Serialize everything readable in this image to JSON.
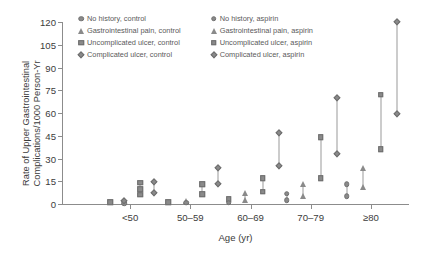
{
  "chart_data": {
    "type": "scatter",
    "title": "",
    "xlabel": "Age (yr)",
    "ylabel_lines": [
      "Rate of Upper Gastrointestinal",
      "Complications/1000 Person-Yr"
    ],
    "categories": [
      "<50",
      "50–59",
      "60–69",
      "70–79",
      "≥80"
    ],
    "yticks": [
      0,
      15,
      30,
      45,
      60,
      75,
      90,
      105,
      120
    ],
    "ylim": [
      0,
      120
    ],
    "grid": false,
    "legend_position": "top-center",
    "marker_color": "#8a8a8a",
    "axis_color": "#8c8c8c",
    "series": [
      {
        "name": "No history, control",
        "marker": "circle",
        "group": "control",
        "icon": "circle-marker-icon",
        "values": [
          0.3,
          0.5,
          0.9,
          2.6,
          5.0
        ]
      },
      {
        "name": "Gastrointestinal pain, control",
        "marker": "triangle",
        "group": "control",
        "icon": "triangle-marker-icon",
        "values": [
          0.9,
          1.2,
          2.3,
          5.2,
          11.5
        ]
      },
      {
        "name": "Uncomplicated ulcer, control",
        "marker": "square",
        "group": "control",
        "icon": "square-marker-icon",
        "values": [
          1.0,
          1.4,
          2.0,
          17.0,
          36.0
        ]
      },
      {
        "name": "Complicated ulcer, control",
        "marker": "diamond",
        "group": "control",
        "icon": "diamond-marker-icon",
        "values": [
          0.9,
          13.0,
          25.0,
          33.0,
          59.5
        ]
      },
      {
        "name": "No history, aspirin",
        "marker": "circle",
        "group": "aspirin",
        "icon": "circle-marker-icon",
        "values": [
          0.8,
          1.1,
          2.8,
          6.8,
          13.0
        ]
      },
      {
        "name": "Gastrointestinal pain, aspirin",
        "marker": "triangle",
        "group": "aspirin",
        "icon": "triangle-marker-icon",
        "values": [
          1.3,
          1.8,
          7.0,
          13.0,
          24.0
        ]
      },
      {
        "name": "Uncomplicated ulcer, aspirin",
        "marker": "square",
        "group": "aspirin",
        "icon": "square-marker-icon",
        "values": [
          14.0,
          8.0,
          8.0,
          44.0,
          72.0
        ]
      },
      {
        "name": "Complicated ulcer, aspirin",
        "marker": "diamond",
        "group": "aspirin",
        "icon": "diamond-marker-icon",
        "values": [
          14.5,
          24.0,
          46.5,
          70.0,
          120.0
        ]
      }
    ],
    "points": [
      {
        "cat": 0,
        "off": -20,
        "marker": "square",
        "value": 1.0,
        "label": "Uncomplicated ulcer, control"
      },
      {
        "cat": 0,
        "off": -6,
        "marker": "triangle",
        "value": 1.4,
        "label": "Gastrointestinal pain, control"
      },
      {
        "cat": 0,
        "off": -6,
        "marker": "circle",
        "value": 0.4,
        "label": "No history, control"
      },
      {
        "cat": 0,
        "off": -6,
        "marker": "diamond",
        "value": 2.2,
        "label": "Complicated ulcer, control"
      },
      {
        "cat": 0,
        "off": 10,
        "marker": "square",
        "value": 14.0,
        "label": "Uncomplicated ulcer, aspirin"
      },
      {
        "cat": 0,
        "off": 10,
        "marker": "square",
        "value": 9.8,
        "label": "Uncomplicated ulcer, aspirin"
      },
      {
        "cat": 0,
        "off": 10,
        "marker": "square",
        "value": 6.0,
        "label": "Uncomplicated ulcer, aspirin"
      },
      {
        "cat": 0,
        "off": 24,
        "marker": "diamond",
        "value": 14.5,
        "label": "Complicated ulcer, aspirin"
      },
      {
        "cat": 0,
        "off": 24,
        "marker": "diamond",
        "value": 7.5,
        "label": "Complicated ulcer, control"
      },
      {
        "cat": 1,
        "off": -22,
        "marker": "square",
        "value": 1.2,
        "label": "Uncomplicated ulcer, control"
      },
      {
        "cat": 1,
        "off": -4,
        "marker": "triangle",
        "value": 2.2,
        "label": "Gastrointestinal pain, aspirin"
      },
      {
        "cat": 1,
        "off": -4,
        "marker": "circle",
        "value": 0.8,
        "label": "No history, control"
      },
      {
        "cat": 1,
        "off": 12,
        "marker": "square",
        "value": 13.0,
        "label": "Uncomplicated ulcer, aspirin"
      },
      {
        "cat": 1,
        "off": 12,
        "marker": "square",
        "value": 6.5,
        "label": "Uncomplicated ulcer, control"
      },
      {
        "cat": 1,
        "off": 28,
        "marker": "diamond",
        "value": 24.0,
        "label": "Complicated ulcer, aspirin"
      },
      {
        "cat": 1,
        "off": 28,
        "marker": "diamond",
        "value": 13.0,
        "label": "Complicated ulcer, control"
      },
      {
        "cat": 2,
        "off": -22,
        "marker": "square",
        "value": 3.0,
        "label": "Uncomplicated ulcer, control"
      },
      {
        "cat": 2,
        "off": -22,
        "marker": "circle",
        "value": 0.8,
        "label": "No history, control"
      },
      {
        "cat": 2,
        "off": -6,
        "marker": "triangle",
        "value": 7.0,
        "label": "Gastrointestinal pain, aspirin"
      },
      {
        "cat": 2,
        "off": -6,
        "marker": "triangle",
        "value": 2.5,
        "label": "Gastrointestinal pain, control"
      },
      {
        "cat": 2,
        "off": 12,
        "marker": "square",
        "value": 17.0,
        "label": "Uncomplicated ulcer, aspirin"
      },
      {
        "cat": 2,
        "off": 12,
        "marker": "square",
        "value": 8.0,
        "label": "Uncomplicated ulcer, control"
      },
      {
        "cat": 2,
        "off": 28,
        "marker": "diamond",
        "value": 46.5,
        "label": "Complicated ulcer, aspirin"
      },
      {
        "cat": 2,
        "off": 28,
        "marker": "diamond",
        "value": 25.0,
        "label": "Complicated ulcer, control"
      },
      {
        "cat": 3,
        "off": -24,
        "marker": "circle",
        "value": 6.8,
        "label": "No history, aspirin"
      },
      {
        "cat": 3,
        "off": -24,
        "marker": "circle",
        "value": 2.6,
        "label": "No history, control"
      },
      {
        "cat": 3,
        "off": -8,
        "marker": "triangle",
        "value": 13.0,
        "label": "Gastrointestinal pain, aspirin"
      },
      {
        "cat": 3,
        "off": -8,
        "marker": "triangle",
        "value": 5.2,
        "label": "Gastrointestinal pain, control"
      },
      {
        "cat": 3,
        "off": 10,
        "marker": "square",
        "value": 44.0,
        "label": "Uncomplicated ulcer, aspirin"
      },
      {
        "cat": 3,
        "off": 10,
        "marker": "square",
        "value": 17.0,
        "label": "Uncomplicated ulcer, control"
      },
      {
        "cat": 3,
        "off": 26,
        "marker": "diamond",
        "value": 70.0,
        "label": "Complicated ulcer, aspirin"
      },
      {
        "cat": 3,
        "off": 26,
        "marker": "diamond",
        "value": 33.0,
        "label": "Complicated ulcer, control"
      },
      {
        "cat": 4,
        "off": -24,
        "marker": "circle",
        "value": 13.0,
        "label": "No history, aspirin"
      },
      {
        "cat": 4,
        "off": -24,
        "marker": "circle",
        "value": 5.0,
        "label": "No history, control"
      },
      {
        "cat": 4,
        "off": -8,
        "marker": "triangle",
        "value": 24.0,
        "label": "Gastrointestinal pain, aspirin"
      },
      {
        "cat": 4,
        "off": -8,
        "marker": "triangle",
        "value": 11.5,
        "label": "Gastrointestinal pain, control"
      },
      {
        "cat": 4,
        "off": 10,
        "marker": "square",
        "value": 72.0,
        "label": "Uncomplicated ulcer, aspirin"
      },
      {
        "cat": 4,
        "off": 10,
        "marker": "square",
        "value": 36.0,
        "label": "Uncomplicated ulcer, control"
      },
      {
        "cat": 4,
        "off": 26,
        "marker": "diamond",
        "value": 120.0,
        "label": "Complicated ulcer, aspirin"
      },
      {
        "cat": 4,
        "off": 26,
        "marker": "diamond",
        "value": 59.5,
        "label": "Complicated ulcer, control"
      }
    ],
    "connectors": [
      {
        "cat": 0,
        "off": 10,
        "low": 6.0,
        "high": 14.0
      },
      {
        "cat": 0,
        "off": 24,
        "low": 7.5,
        "high": 14.5
      },
      {
        "cat": 1,
        "off": 12,
        "low": 6.5,
        "high": 13.0
      },
      {
        "cat": 1,
        "off": 28,
        "low": 13.0,
        "high": 24.0
      },
      {
        "cat": 2,
        "off": -6,
        "low": 2.5,
        "high": 7.0
      },
      {
        "cat": 2,
        "off": 12,
        "low": 8.0,
        "high": 17.0
      },
      {
        "cat": 2,
        "off": 28,
        "low": 25.0,
        "high": 46.5
      },
      {
        "cat": 3,
        "off": -24,
        "low": 2.6,
        "high": 6.8
      },
      {
        "cat": 3,
        "off": -8,
        "low": 5.2,
        "high": 13.0
      },
      {
        "cat": 3,
        "off": 10,
        "low": 17.0,
        "high": 44.0
      },
      {
        "cat": 3,
        "off": 26,
        "low": 33.0,
        "high": 70.0
      },
      {
        "cat": 4,
        "off": -24,
        "low": 5.0,
        "high": 13.0
      },
      {
        "cat": 4,
        "off": -8,
        "low": 11.5,
        "high": 24.0
      },
      {
        "cat": 4,
        "off": 10,
        "low": 36.0,
        "high": 72.0
      },
      {
        "cat": 4,
        "off": 26,
        "low": 59.5,
        "high": 120.0
      }
    ]
  },
  "legend": {
    "columns": [
      {
        "items": [
          {
            "label": "No history, control",
            "marker": "circle",
            "icon": "circle-marker-icon"
          },
          {
            "label": "Gastrointestinal pain, control",
            "marker": "triangle",
            "icon": "triangle-marker-icon"
          },
          {
            "label": "Uncomplicated ulcer, control",
            "marker": "square",
            "icon": "square-marker-icon"
          },
          {
            "label": "Complicated ulcer, control",
            "marker": "diamond",
            "icon": "diamond-marker-icon"
          }
        ]
      },
      {
        "items": [
          {
            "label": "No history, aspirin",
            "marker": "circle",
            "icon": "circle-marker-icon"
          },
          {
            "label": "Gastrointestinal pain, aspirin",
            "marker": "triangle",
            "icon": "triangle-marker-icon"
          },
          {
            "label": "Uncomplicated ulcer, aspirin",
            "marker": "square",
            "icon": "square-marker-icon"
          },
          {
            "label": "Complicated ulcer, aspirin",
            "marker": "diamond",
            "icon": "diamond-marker-icon"
          }
        ]
      }
    ]
  }
}
